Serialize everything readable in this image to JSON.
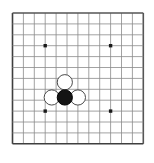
{
  "diagram": {
    "kind": "go-board",
    "board": {
      "grid_lines_horizontal": 13,
      "grid_lines_vertical": 13,
      "origin_x_px": 12.5,
      "origin_y_px": 13.0,
      "spacing_px": 10.9,
      "line_color": "#8a8a8a",
      "border_color": "#555555",
      "border_left_color": "#3f3f3f",
      "border_bottom_color": "#3f3f3f",
      "line_width": 0.8,
      "border_width": 1.6,
      "background_color": "#ffffff"
    },
    "star_points": {
      "color": "#1a1a1a",
      "size_px": 3.4,
      "points": [
        {
          "col": 3,
          "row": 3
        },
        {
          "col": 9,
          "row": 3
        },
        {
          "col": 3,
          "row": 9
        },
        {
          "col": 9,
          "row": 9
        }
      ]
    },
    "stones": {
      "radius_px": 7.6,
      "black_fill": "#141414",
      "black_stroke": "#000000",
      "white_fill": "#ffffff",
      "white_stroke": "#4a4a4a",
      "stroke_width": 1.0,
      "items": [
        {
          "label": "white-stone-top",
          "color": "white",
          "col": 4.8,
          "row": 6.35
        },
        {
          "label": "white-stone-left",
          "color": "white",
          "col": 3.6,
          "row": 7.75
        },
        {
          "label": "white-stone-right",
          "color": "white",
          "col": 6.0,
          "row": 7.75
        },
        {
          "label": "black-stone-center",
          "color": "black",
          "col": 4.8,
          "row": 7.75
        }
      ]
    }
  }
}
